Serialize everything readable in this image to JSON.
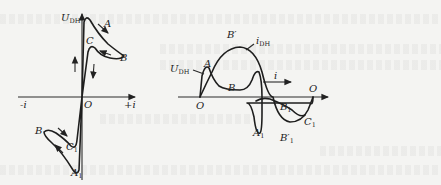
{
  "figure": {
    "left_panel": {
      "title": "U_DH vs i loop",
      "y_axis_label": "U",
      "y_axis_label_sub": "DH",
      "x_neg_label": "-i",
      "x_pos_label": "+i",
      "origin_label": "O",
      "points": {
        "A": "A",
        "B": "B",
        "C": "C",
        "B_lower": "B",
        "C1": "C",
        "C1_sub": "1",
        "A1": "A",
        "A1_sub": "1"
      }
    },
    "right_panel": {
      "title": "U_DH and i_DH waveforms",
      "u_label": "U",
      "u_label_sub": "DH",
      "i_label": "i",
      "i_label_sub": "DH",
      "axis_arrow_label": "i",
      "origin_left": "O",
      "origin_right": "O",
      "points": {
        "A": "A",
        "B_prime": "B′",
        "B": "B",
        "B1": "B",
        "B1_sub": "1",
        "A1": "A",
        "A1_sub": "1",
        "B1_prime": "B′",
        "B1_prime_sub": "1",
        "C1": "C",
        "C1_sub": "1"
      }
    }
  }
}
